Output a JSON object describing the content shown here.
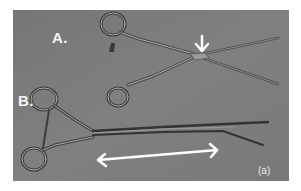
{
  "figure": {
    "background_color": "#7c7c7c",
    "labels": {
      "instrument_a": "A.",
      "instrument_b": "B.",
      "panel": "(a)"
    },
    "annotations": [
      {
        "type": "arrow-down",
        "target": "instrument A joint",
        "color": "#ffffff"
      },
      {
        "type": "double-arrow",
        "target": "instrument B shaft length",
        "color": "#ffffff"
      }
    ],
    "subjects": [
      {
        "id": "A",
        "description": "surgical clamp with finger rings, crossed jaws"
      },
      {
        "id": "B",
        "description": "long-shaft surgical clamp with finger rings"
      }
    ]
  }
}
